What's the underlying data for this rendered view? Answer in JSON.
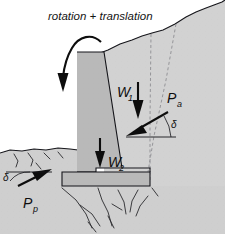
{
  "figure": {
    "title": "rotation + translation",
    "caption_style": "italic",
    "width": 225,
    "height": 234,
    "background_color": "#ffffff"
  },
  "colors": {
    "wall_fill": "#b9b9b9",
    "backfill_fill": "#d2d2d2",
    "foundation_fill": "#c9c9c9",
    "lower_ground_fill": "#cfcfcf",
    "outline": "#15151a",
    "dashed_failure_line": "#8d8d92",
    "arrow": "#0d0d0d",
    "background": "#ffffff"
  },
  "labels": {
    "title": "rotation + translation",
    "weight_upper": "W",
    "weight_upper_sub": "1",
    "weight_lower": "W",
    "weight_lower_sub": "2",
    "active_pressure": "P",
    "active_pressure_sub": "a",
    "passive_pressure": "P",
    "passive_pressure_sub": "p",
    "delta_right": "δ",
    "delta_left": "δ"
  },
  "elements": {
    "rotation_arrow": {
      "name": "rotation-translation-arrow",
      "description": "curved arrow showing wall rotation and translation"
    },
    "weight_arrow_1": {
      "name": "weight-w1-arrow",
      "direction": "down"
    },
    "weight_arrow_2": {
      "name": "weight-w2-arrow",
      "direction": "down"
    },
    "active_force_arrow": {
      "name": "active-pressure-arrow",
      "direction": "down-left"
    },
    "passive_force_arrow": {
      "name": "passive-pressure-arrow",
      "direction": "up-right"
    },
    "retaining_wall": {
      "name": "retaining-wall-body"
    },
    "wall_footing": {
      "name": "wall-footing-slab"
    },
    "backfill": {
      "name": "backfill-soil-mass"
    },
    "lower_ground": {
      "name": "lower-ground-soil"
    },
    "failure_planes": {
      "name": "failure-plane-dashed-lines",
      "count": 2
    },
    "angle_arc_right": {
      "name": "delta-angle-arc-right"
    },
    "angle_arc_left": {
      "name": "delta-angle-arc-left"
    }
  }
}
